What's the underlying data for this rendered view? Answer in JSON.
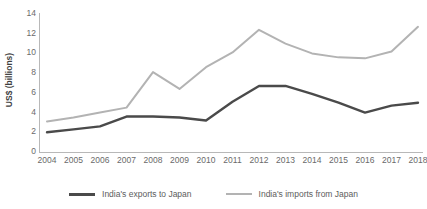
{
  "chart_data": {
    "type": "line",
    "title": "",
    "xlabel": "",
    "ylabel": "US$ (billions)",
    "grid": false,
    "legend_position": "bottom",
    "ylim": [
      0,
      14
    ],
    "yticks": [
      0,
      2,
      4,
      6,
      8,
      10,
      12,
      14
    ],
    "categories": [
      "2004",
      "2005",
      "2006",
      "2007",
      "2008",
      "2009",
      "2010",
      "2011",
      "2012",
      "2013",
      "2014",
      "2015",
      "2016",
      "2017",
      "2018"
    ],
    "series": [
      {
        "name": "India's exports to Japan",
        "color": "#4a4a4a",
        "values": [
          2.0,
          2.3,
          2.6,
          3.6,
          3.6,
          3.5,
          3.2,
          5.1,
          6.7,
          6.7,
          5.9,
          5.0,
          4.0,
          4.7,
          5.0
        ]
      },
      {
        "name": "India's imports from Japan",
        "color": "#b3b3b3",
        "values": [
          3.1,
          3.5,
          4.0,
          4.5,
          8.1,
          6.4,
          8.6,
          10.1,
          12.4,
          11.0,
          10.0,
          9.6,
          9.5,
          10.2,
          12.7
        ]
      }
    ]
  },
  "axis": {
    "y_title": "US$ (billions)",
    "y_tick_labels": [
      "14",
      "12",
      "10",
      "8",
      "6",
      "4",
      "2",
      "0"
    ],
    "x_tick_labels": [
      "2004",
      "2005",
      "2006",
      "2007",
      "2008",
      "2009",
      "2010",
      "2011",
      "2012",
      "2013",
      "2014",
      "2015",
      "2016",
      "2017",
      "2018"
    ]
  },
  "legend": {
    "entries": [
      {
        "label": "India's exports to Japan",
        "color": "#4a4a4a"
      },
      {
        "label": "India's imports from Japan",
        "color": "#b3b3b3"
      }
    ]
  },
  "colors": {
    "exports_line": "#4a4a4a",
    "imports_line": "#b3b3b3",
    "axis": "#b8b8b8",
    "text": "#6a6a6a",
    "background": "#ffffff"
  }
}
